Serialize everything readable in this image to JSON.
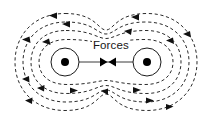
{
  "diagram": {
    "type": "physics-force-field-diagram",
    "title_label": "Forces",
    "background_color": "#ffffff",
    "stroke_color": "#2b2b2b",
    "body_fill": "#ffffff",
    "dot_color": "#000000",
    "canvas": {
      "width": 212,
      "height": 121
    },
    "bodies": [
      {
        "id": "left-mass",
        "name": "left-body",
        "cx": 65,
        "cy": 62,
        "r": 14,
        "dot_r": 4
      },
      {
        "id": "right-mass",
        "name": "right-body",
        "cx": 147,
        "cy": 62,
        "r": 14,
        "dot_r": 4
      }
    ],
    "force_connector": {
      "label": "Forces",
      "x1": 79,
      "x2": 133,
      "y": 62,
      "arrow_direction": "inward-opposing",
      "arrow_count": 2
    },
    "field_loops": [
      {
        "id": "loop-1",
        "index": 1,
        "label": "innermost-field-line",
        "inset": 0
      },
      {
        "id": "loop-2",
        "index": 2,
        "label": "field-line",
        "inset": 1
      },
      {
        "id": "loop-3",
        "index": 3,
        "label": "field-line",
        "inset": 2
      },
      {
        "id": "loop-4",
        "index": 4,
        "label": "outermost-field-line",
        "inset": 3
      }
    ],
    "flow_direction": "counterclockwise",
    "arrow_marker_count": 16,
    "label_position": {
      "x": 92,
      "y": 39
    }
  }
}
